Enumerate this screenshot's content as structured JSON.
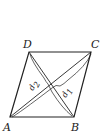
{
  "figure": {
    "shape": "rhombus",
    "vertices": {
      "A": {
        "label": "A",
        "x": 10,
        "y": 117
      },
      "B": {
        "label": "B",
        "x": 74,
        "y": 117
      },
      "C": {
        "label": "C",
        "x": 91,
        "y": 52
      },
      "D": {
        "label": "D",
        "x": 29,
        "y": 52
      }
    },
    "diagonals": [
      {
        "name": "d1",
        "from": "A",
        "to": "C",
        "label": "d",
        "subscript": "1"
      },
      {
        "name": "d2",
        "from": "B",
        "to": "D",
        "label": "d",
        "subscript": "2"
      }
    ],
    "stroke_color": "#222222"
  }
}
